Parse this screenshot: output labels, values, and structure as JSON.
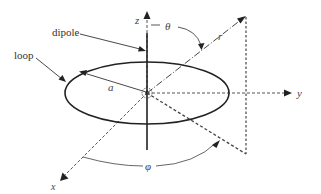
{
  "diagram": {
    "type": "3d-coordinate-schematic",
    "labels": {
      "loop": "loop",
      "dipole": "dipole",
      "radius": "a",
      "z_axis": "z",
      "y_axis": "y",
      "x_axis": "x",
      "r": "r",
      "theta": "θ",
      "phi": "φ"
    },
    "colors": {
      "line": "#222222",
      "dashed": "#555555",
      "text": "#333333",
      "background": "#ffffff"
    },
    "geometry": {
      "origin": [
        147,
        93
      ],
      "loop_radii": [
        82,
        31
      ],
      "z_arrow_tip": [
        147,
        12
      ],
      "y_arrow_tip": [
        291,
        93
      ],
      "x_arrow_tip": [
        60,
        181
      ],
      "r_tip": [
        245,
        17
      ],
      "projection_foot": [
        246,
        153
      ]
    }
  }
}
